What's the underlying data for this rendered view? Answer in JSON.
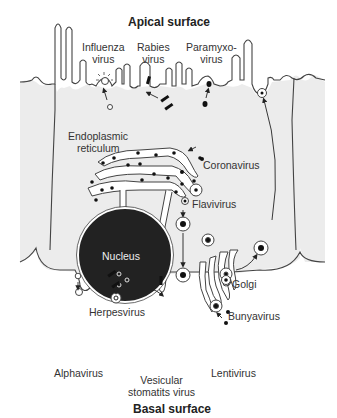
{
  "diagram": {
    "title_top": "Apical surface",
    "title_bottom": "Basal surface",
    "colors": {
      "cell_fill": "#ececec",
      "outline": "#444444",
      "nucleus": "#222222",
      "virion": "#111111"
    },
    "organelles": {
      "er_label_line1": "Endoplasmic",
      "er_label_line2": "reticulum",
      "nucleus": "Nucleus",
      "golgi": "Golgi"
    },
    "viruses": {
      "influenza_1": "Influenza",
      "influenza_2": "virus",
      "rabies_1": "Rabies",
      "rabies_2": "virus",
      "paramyxo_1": "Paramyxo-",
      "paramyxo_2": "virus",
      "coronavirus": "Coronavirus",
      "flavivirus": "Flavivirus",
      "herpesvirus": "Herpesvirus",
      "bunyavirus": "Bunyavirus",
      "alphavirus": "Alphavirus",
      "vsv_1": "Vesicular",
      "vsv_2": "stomatits virus",
      "lentivirus": "Lentivirus"
    }
  }
}
